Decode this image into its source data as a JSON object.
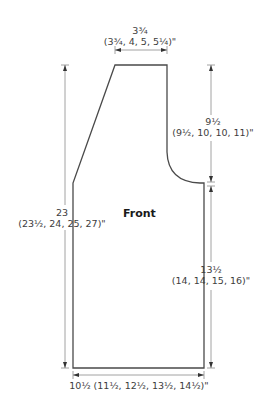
{
  "piece": {
    "title": "Front",
    "outline_color": "#4a4a4a",
    "dimension_line_color": "#9a9a9a"
  },
  "dimensions": {
    "neck_width": {
      "main": "3¾",
      "sizes": "(3¾, 4, 5, 5¼)\""
    },
    "armhole_depth": {
      "main": "9½",
      "sizes": "(9½, 10, 10, 11)\""
    },
    "total_length": {
      "main": "23",
      "sizes": "(23½, 24, 25, 27)\""
    },
    "side_length": {
      "main": "13½",
      "sizes": "(14, 14, 15, 16)\""
    },
    "bottom_width": {
      "full": "10½ (11½, 12½, 13½, 14½)\""
    }
  }
}
